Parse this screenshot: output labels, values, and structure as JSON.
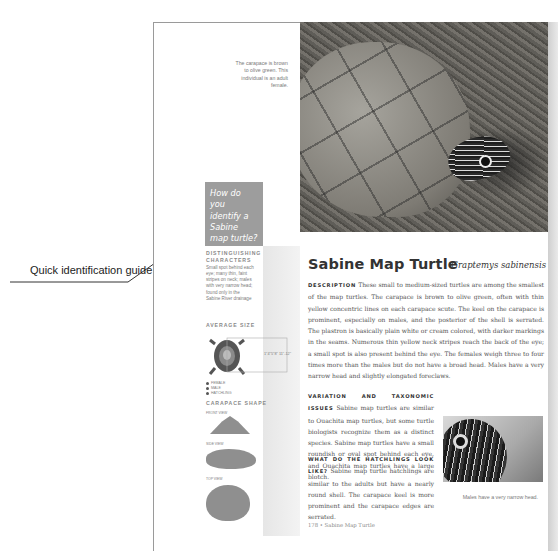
{
  "annotation": {
    "label": "Quick identification guide"
  },
  "photo_caption": "The carapace is brown to olive green. This individual is an adult female.",
  "callout": {
    "question": "How do you identify a Sabine map turtle?"
  },
  "sidebar": {
    "distinguishing_heading": "Distinguishing characters",
    "distinguishing_text": "Small spot behind each eye; many thin, faint stripes on neck; males with very narrow head; found only in the Sabine River drainage",
    "size_heading": "Average size",
    "size_value": "1\"4\"5\"8\" 11\"-12\"",
    "size_legend": [
      "FEMALE",
      "MALE",
      "HATCHLING"
    ],
    "shape_heading": "Carapace shape",
    "shape_views": [
      "FRONT VIEW",
      "SIDE VIEW",
      "TOP VIEW"
    ]
  },
  "article": {
    "title": "Sabine Map Turtle",
    "scientific_name": "Graptemys sabinensis",
    "sections": [
      {
        "lead": "Description",
        "text": "These small to medium-sized turtles are among the smallest of the map turtles. The carapace is brown to olive green, often with thin yellow concentric lines on each carapace scute. The keel on the carapace is prominent, especially on males, and the posterior of the shell is serrated. The plastron is basically plain white or cream colored, with darker markings in the seams. Numerous thin yellow neck stripes reach the back of the eye; a small spot is also present behind the eye. The females weigh three to four times more than the males but do not have a broad head. Males have a very narrow head and slightly elongated foreclaws."
      },
      {
        "lead": "Variation and taxonomic issues",
        "text": "Sabine map turtles are similar to Ouachita map turtles, but some turtle biologists recognize them as a distinct species. Sabine map turtles have a small roundish or oval spot behind each eye, and Ouachita map turtles have a large blotch."
      },
      {
        "lead": "What do the hatchlings look like?",
        "text": "Sabine map turtle hatchlings are similar to the adults but have a nearly round shell. The carapace keel is more prominent and the carapace edges are serrated."
      }
    ],
    "photo2_caption": "Males have a very narrow head.",
    "footer": "178 • Sabine Map Turtle"
  }
}
